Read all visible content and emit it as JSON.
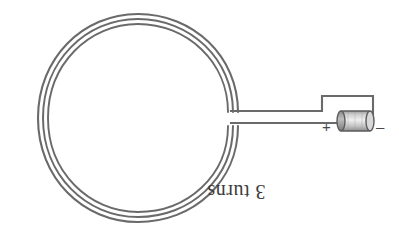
{
  "figure": {
    "background_color": "#ffffff",
    "wire_color": "#6a6a6a",
    "label_color": "#3b3b3b",
    "battery_body_color": "#b5b5b5",
    "battery_edge_color": "#5c5c5c",
    "width": 399,
    "height": 248
  },
  "labels": {
    "turns": "3 turns",
    "turns_rotation_degrees": 180,
    "battery_positive": "+",
    "battery_negative": "–"
  },
  "coil": {
    "name": "circular coil",
    "turn_count": 3,
    "center_x": 138,
    "center_y": 118,
    "radius_outer_x": 100,
    "radius_outer_y": 104,
    "turn_spacing": 5
  },
  "circuit": {
    "lead_top_y": 111,
    "lead_bottom_y": 123,
    "lead_start_x": 231,
    "riser_x": 322,
    "top_rail_y": 96,
    "right_x": 373,
    "battery": {
      "name": "battery-cell",
      "left_x": 339,
      "right_x": 372,
      "center_y": 121,
      "height": 19
    }
  }
}
